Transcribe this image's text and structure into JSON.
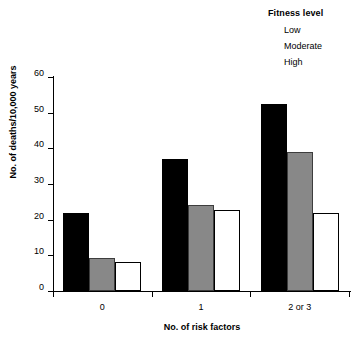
{
  "chart_data": {
    "type": "bar",
    "title": "",
    "subtitle": "",
    "xlabel": "No. of risk factors",
    "ylabel": "No. of deaths/10,000 years",
    "categories": [
      "0",
      "1",
      "2 or 3"
    ],
    "series": [
      {
        "name": "Low",
        "color": "#000000",
        "values": [
          22,
          37,
          52.5
        ]
      },
      {
        "name": "Moderate",
        "color": "#888888",
        "values": [
          9.3,
          24,
          39
        ]
      },
      {
        "name": "High",
        "color": "#ffffff",
        "values": [
          8,
          22.8,
          21.8
        ]
      }
    ],
    "ylim": [
      0,
      60
    ],
    "yticks": [
      0,
      10,
      20,
      30,
      40,
      50,
      60
    ],
    "ytick_labels": [
      "0",
      "10",
      "20",
      "30",
      "40",
      "50",
      "60"
    ],
    "grid": false,
    "legend_position": "top-right",
    "legend_title": "Fitness level",
    "annotations": []
  },
  "legend": {
    "title": "Fitness level",
    "items": [
      {
        "label": "Low",
        "swatch": "black-swatch"
      },
      {
        "label": "Moderate",
        "swatch": "gray-swatch"
      },
      {
        "label": "High",
        "swatch": "white-swatch"
      }
    ]
  },
  "axes": {
    "y_title": "No. of deaths/10,000 years",
    "x_title": "No. of risk factors",
    "y_tick_labels": [
      "0",
      "10",
      "20",
      "30",
      "40",
      "50",
      "60"
    ],
    "x_tick_labels": [
      "0",
      "1",
      "2 or 3"
    ]
  },
  "colors": {
    "low": "#000000",
    "moderate": "#888888",
    "high": "#ffffff",
    "axis": "#000000",
    "background": "#ffffff"
  }
}
